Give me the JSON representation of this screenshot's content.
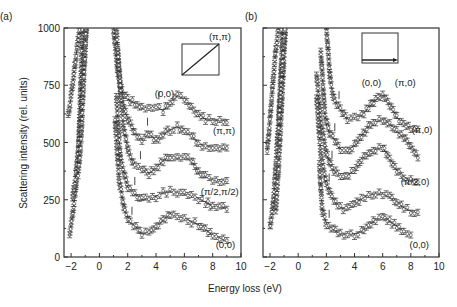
{
  "figure": {
    "xlabel": "Energy loss (eV)",
    "ylabel": "Scattering intensity (rel. units)"
  },
  "chart_data": [
    {
      "panel": "(a)",
      "type": "scatter",
      "xlabel": "Energy loss (eV)",
      "ylabel": "Scattering intensity (rel. units)",
      "xlim": [
        -2.5,
        10
      ],
      "ylim": [
        0,
        1000
      ],
      "xticks": [
        -2,
        0,
        2,
        4,
        6,
        8,
        10
      ],
      "yticks": [
        0,
        250,
        500,
        750,
        1000
      ],
      "inset": {
        "from": "(0,0)",
        "to": "(π,π)",
        "direction": "diagonal"
      },
      "annotations": [
        {
          "text": "(0,0)",
          "x": 4.6,
          "y": 700
        },
        {
          "text": "(π,π)",
          "x": 8.8,
          "y": 535
        },
        {
          "text": "(π/2,π/2)",
          "x": 8.5,
          "y": 270
        },
        {
          "text": "(0,0)",
          "x": 8.9,
          "y": 40
        }
      ],
      "series": [
        {
          "name": "(0,0) upper",
          "marker_x": 4.2,
          "x": [
            1.0,
            1.3,
            1.6,
            2.0,
            2.5,
            3.0,
            3.5,
            4.0,
            4.5,
            5.0,
            5.5,
            6.0,
            6.5,
            7.0,
            7.5,
            8.0,
            8.5,
            9.0
          ],
          "y": [
            1000,
            800,
            720,
            690,
            670,
            650,
            650,
            655,
            640,
            670,
            705,
            690,
            655,
            625,
            600,
            598,
            595,
            595
          ]
        },
        {
          "name": "(π,π)",
          "marker_x": 3.4,
          "x": [
            1.2,
            1.5,
            2.0,
            2.5,
            3.0,
            3.5,
            4.0,
            4.5,
            5.0,
            5.5,
            6.0,
            6.5,
            7.0,
            7.5,
            8.0,
            8.5,
            9.0
          ],
          "y": [
            1000,
            700,
            600,
            545,
            510,
            540,
            510,
            535,
            555,
            570,
            545,
            530,
            495,
            485,
            480,
            475,
            470
          ]
        },
        {
          "name": "(π/2,π/2) upper",
          "marker_x": 2.9,
          "x": [
            1.3,
            1.7,
            2.1,
            2.5,
            3.0,
            3.5,
            4.0,
            4.5,
            5.0,
            5.5,
            6.0,
            6.5,
            7.0,
            7.5,
            8.0,
            8.5,
            9.0
          ],
          "y": [
            900,
            560,
            450,
            400,
            385,
            365,
            390,
            420,
            440,
            430,
            435,
            420,
            370,
            350,
            335,
            330,
            330
          ]
        },
        {
          "name": "(π/2,π/2)",
          "marker_x": 2.5,
          "x": [
            1.2,
            1.5,
            2.0,
            2.5,
            3.0,
            3.5,
            4.0,
            4.5,
            5.0,
            5.5,
            6.0,
            6.5,
            7.0,
            7.5,
            8.0,
            8.5,
            9.0
          ],
          "y": [
            700,
            420,
            305,
            275,
            250,
            255,
            265,
            280,
            285,
            280,
            275,
            270,
            255,
            240,
            222,
            218,
            215
          ]
        },
        {
          "name": "(0,0)",
          "marker_x": 2.3,
          "x": [
            1.1,
            1.4,
            1.8,
            2.2,
            2.6,
            3.0,
            3.5,
            4.0,
            4.5,
            5.0,
            5.5,
            6.0,
            6.5,
            7.0,
            7.5,
            8.0,
            8.5,
            9.0
          ],
          "y": [
            600,
            330,
            200,
            150,
            130,
            100,
            110,
            130,
            160,
            190,
            175,
            170,
            155,
            140,
            120,
            95,
            82,
            70
          ]
        },
        {
          "name": "elastic-left-1",
          "x": [
            -2.1,
            -1.9,
            -1.7,
            -1.5,
            -1.3,
            -1.2
          ],
          "y": [
            100,
            180,
            280,
            420,
            800,
            1000
          ]
        },
        {
          "name": "elastic-left-2",
          "x": [
            -2.2,
            -2.0,
            -1.8,
            -1.6,
            -1.4,
            -1.2,
            -1.0,
            -0.9
          ],
          "y": [
            620,
            700,
            800,
            900,
            1000,
            1000,
            1000,
            1000
          ]
        },
        {
          "name": "elastic-left-3",
          "x": [
            -1.9,
            -1.7,
            -1.5,
            -1.3,
            -1.1,
            -0.9
          ],
          "y": [
            250,
            340,
            470,
            620,
            880,
            1000
          ]
        },
        {
          "name": "elastic-left-4",
          "x": [
            -1.5,
            -1.3,
            -1.1,
            -1.0,
            -0.95
          ],
          "y": [
            360,
            500,
            780,
            900,
            1000
          ]
        }
      ]
    },
    {
      "panel": "(b)",
      "type": "scatter",
      "xlabel": "Energy loss (eV)",
      "ylabel": "",
      "xlim": [
        -2.5,
        10
      ],
      "ylim": [
        0,
        1000
      ],
      "xticks": [
        -2,
        0,
        2,
        4,
        6,
        8,
        10
      ],
      "inset": {
        "from": "(0,0)",
        "to": "(π,0)",
        "direction": "horizontal"
      },
      "annotations": [
        {
          "text": "(0,0)",
          "x": 5.2,
          "y": 745
        },
        {
          "text": "(π,0)",
          "x": 7.6,
          "y": 745
        },
        {
          "text": "(π,0)",
          "x": 8.8,
          "y": 540
        },
        {
          "text": "(π/2,0)",
          "x": 8.3,
          "y": 315
        },
        {
          "text": "(0,0)",
          "x": 8.6,
          "y": 40
        }
      ],
      "series": [
        {
          "name": "(0,0) upper",
          "marker_x": 2.9,
          "x": [
            2.0,
            2.3,
            2.6,
            3.0,
            3.5,
            4.0,
            4.5,
            5.0,
            5.5,
            6.0,
            6.5,
            7.0,
            7.5,
            8.0,
            8.5
          ],
          "y": [
            1000,
            760,
            680,
            640,
            600,
            610,
            620,
            650,
            690,
            710,
            660,
            610,
            580,
            560,
            550
          ]
        },
        {
          "name": "(π,0)",
          "marker_x": 2.6,
          "x": [
            1.6,
            1.9,
            2.2,
            2.6,
            3.0,
            3.5,
            4.0,
            4.5,
            5.0,
            5.5,
            6.0,
            6.5,
            7.0,
            7.5,
            8.0,
            8.5
          ],
          "y": [
            900,
            620,
            540,
            510,
            470,
            460,
            490,
            530,
            570,
            590,
            600,
            580,
            550,
            520,
            480,
            440
          ]
        },
        {
          "name": "(π/2,0) upper",
          "marker_x": 2.4,
          "x": [
            1.3,
            1.6,
            2.0,
            2.4,
            2.8,
            3.2,
            3.6,
            4.0,
            4.5,
            5.0,
            5.5,
            6.0,
            6.5,
            7.0,
            7.5,
            8.0,
            8.5
          ],
          "y": [
            800,
            600,
            450,
            390,
            360,
            345,
            360,
            380,
            430,
            450,
            470,
            480,
            430,
            380,
            350,
            335,
            325
          ]
        },
        {
          "name": "(π/2,0)",
          "marker_x": 2.2,
          "x": [
            1.3,
            1.6,
            2.0,
            2.4,
            2.8,
            3.2,
            3.6,
            4.0,
            4.5,
            5.0,
            5.5,
            6.0,
            6.5,
            7.0,
            7.5,
            8.0,
            8.5
          ],
          "y": [
            700,
            450,
            320,
            260,
            225,
            210,
            220,
            235,
            255,
            270,
            275,
            275,
            260,
            235,
            215,
            200,
            190
          ]
        },
        {
          "name": "(0,0)",
          "marker_x": 2.2,
          "x": [
            1.5,
            1.7,
            2.0,
            2.5,
            3.0,
            3.5,
            4.0,
            4.5,
            5.0,
            5.5,
            6.0,
            6.5,
            7.0,
            7.5,
            8.0
          ],
          "y": [
            400,
            210,
            140,
            120,
            100,
            100,
            100,
            115,
            135,
            160,
            175,
            155,
            135,
            110,
            95
          ]
        },
        {
          "name": "elastic-left-1",
          "x": [
            -2.0,
            -1.8,
            -1.6,
            -1.4,
            -1.2,
            -1.1
          ],
          "y": [
            130,
            220,
            390,
            600,
            850,
            1000
          ]
        },
        {
          "name": "elastic-left-2",
          "x": [
            -2.2,
            -2.0,
            -1.8,
            -1.6,
            -1.4,
            -1.2
          ],
          "y": [
            460,
            600,
            760,
            900,
            1000,
            1000
          ]
        },
        {
          "name": "elastic-left-3",
          "x": [
            -1.6,
            -1.4,
            -1.2,
            -1.0,
            -0.9
          ],
          "y": [
            200,
            380,
            620,
            880,
            1000
          ]
        },
        {
          "name": "elastic-left-4",
          "x": [
            -1.4,
            -1.2,
            -1.05,
            -0.95
          ],
          "y": [
            550,
            760,
            920,
            1000
          ]
        }
      ]
    }
  ]
}
